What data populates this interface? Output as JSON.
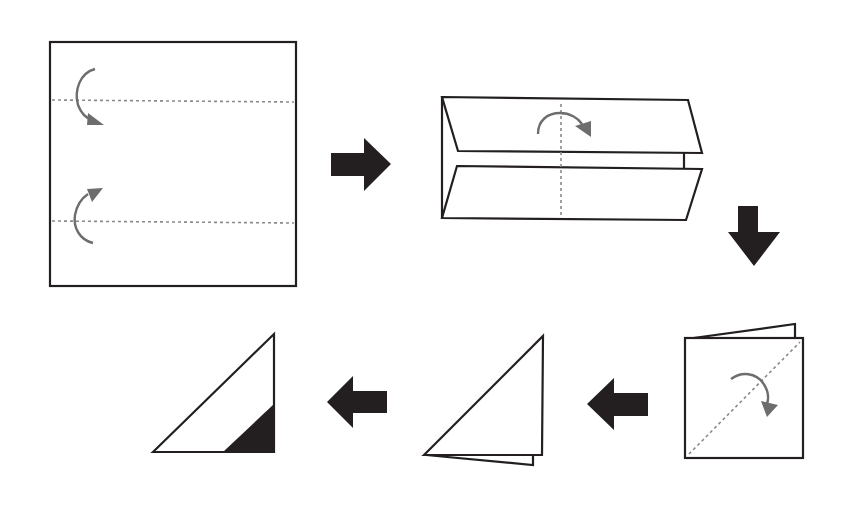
{
  "diagram": {
    "colors": {
      "outline": "#231f20",
      "fold_line": "#8a8a8a",
      "fold_arrow": "#6d6d6d",
      "step_arrow": "#231f20",
      "background": "#ffffff"
    },
    "steps": [
      {
        "id": 1,
        "name": "Square sheet with two horizontal valley folds",
        "fold_lines": 2,
        "fold_arrows": [
          "top-edge-fold-down",
          "bottom-edge-fold-up"
        ]
      },
      {
        "id": 2,
        "name": "Top and bottom folded to center, fold in half along vertical center line",
        "fold_lines": 1,
        "fold_arrows": [
          "fold-right"
        ]
      },
      {
        "id": 3,
        "name": "Folded square with diagonal fold",
        "fold_lines": 1,
        "fold_arrows": [
          "fold-diagonal-down"
        ]
      },
      {
        "id": 4,
        "name": "Folded triangle",
        "fold_lines": 0,
        "fold_arrows": []
      },
      {
        "id": 5,
        "name": "Triangle with black shaded corner",
        "fold_lines": 0,
        "fold_arrows": [],
        "shaded_region": "bottom-right corner"
      }
    ],
    "step_arrows": [
      {
        "from": 1,
        "to": 2,
        "direction": "right"
      },
      {
        "from": 2,
        "to": 3,
        "direction": "down"
      },
      {
        "from": 3,
        "to": 4,
        "direction": "left"
      },
      {
        "from": 4,
        "to": 5,
        "direction": "left"
      }
    ]
  }
}
